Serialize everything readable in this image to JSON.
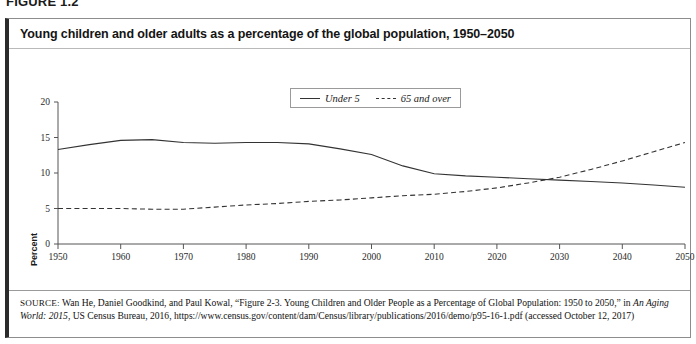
{
  "figure": {
    "number_label": "FIGURE 1.2",
    "title": "Young children and older adults as a percentage of the global population, 1950–2050"
  },
  "legend": {
    "position": "top-center",
    "entries": [
      {
        "label": "Under 5",
        "style": "solid"
      },
      {
        "label": "65 and over",
        "style": "dashed"
      }
    ]
  },
  "axes": {
    "ylabel": "Percent",
    "y_ticks": [
      "0",
      "5",
      "10",
      "15",
      "20"
    ],
    "x_ticks": [
      "1950",
      "1960",
      "1970",
      "1980",
      "1990",
      "2000",
      "2010",
      "2020",
      "2030",
      "2040",
      "2050"
    ]
  },
  "source": {
    "kicker": "SOURCE:",
    "line1": " Wan He, Daniel Goodkind, and Paul Kowal, “Figure 2-3. Young Children and Older People as a Percentage of Global Population: 1950 to 2050,” in ",
    "italic_title": "An Aging World: 2015",
    "line2": ", US Census Bureau, 2016, https://www.census.gov/content/dam/Census/library/publications/2016/demo/p95-16-1.pdf (accessed October 12, 2017)"
  },
  "colors": {
    "line": "#333333",
    "axis": "#555555",
    "panel_border": "#8d8d8d",
    "panel_accent": "#2b2b2b",
    "text": "#141414",
    "background": "#ffffff"
  },
  "chart_data": {
    "type": "line",
    "title": "Young children and older adults as a percentage of the global population, 1950–2050",
    "xlabel": "",
    "ylabel": "Percent",
    "xlim": [
      1950,
      2050
    ],
    "ylim": [
      0,
      20
    ],
    "grid": false,
    "legend_position": "top-center",
    "x": [
      1950,
      1955,
      1960,
      1965,
      1970,
      1975,
      1980,
      1985,
      1990,
      1995,
      2000,
      2005,
      2010,
      2015,
      2020,
      2025,
      2030,
      2035,
      2040,
      2045,
      2050
    ],
    "series": [
      {
        "name": "Under 5",
        "style": "solid",
        "values": [
          13.3,
          14.0,
          14.6,
          14.7,
          14.3,
          14.2,
          14.3,
          14.3,
          14.1,
          13.4,
          12.6,
          11.0,
          9.9,
          9.6,
          9.4,
          9.2,
          9.0,
          8.8,
          8.6,
          8.3,
          8.0
        ]
      },
      {
        "name": "65 and over",
        "style": "dashed",
        "values": [
          5.0,
          5.0,
          5.0,
          4.9,
          4.9,
          5.2,
          5.5,
          5.7,
          6.0,
          6.2,
          6.5,
          6.8,
          7.0,
          7.4,
          7.9,
          8.6,
          9.4,
          10.5,
          11.7,
          13.0,
          14.3
        ]
      }
    ],
    "crossover_year": 2018,
    "annotations": []
  }
}
